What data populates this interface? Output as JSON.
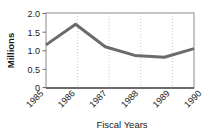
{
  "chart_data": {
    "type": "line",
    "title": "",
    "xlabel": "Fiscal Years",
    "ylabel": "Millions",
    "categories": [
      "1985",
      "1986",
      "1987",
      "1988",
      "1989",
      "1990"
    ],
    "values": [
      1.15,
      1.7,
      1.1,
      0.87,
      0.82,
      1.05
    ],
    "series": [
      {
        "name": "Millions",
        "values": [
          1.15,
          1.7,
          1.1,
          0.87,
          0.82,
          1.05
        ]
      }
    ],
    "ylim": [
      0,
      2.0
    ],
    "yticks": [
      "0",
      "0.5",
      "1.0",
      "1.5",
      "2.0"
    ],
    "ytick_values": [
      0,
      0.5,
      1.0,
      1.5,
      2.0
    ],
    "grid": "vertical-dotted",
    "legend": "none",
    "line_color": "#6b6b6b",
    "frame_color": "#8c8c8c",
    "grid_color": "#bdbdbd",
    "background": "#ffffff"
  },
  "axes": {
    "y_title": "Millions",
    "x_title": "Fiscal Years",
    "y_tick_labels": [
      "2.0",
      "1.5",
      "1.0",
      "0.5",
      "0"
    ],
    "x_tick_labels": [
      "1985",
      "1986",
      "1987",
      "1988",
      "1989",
      "1990"
    ]
  }
}
